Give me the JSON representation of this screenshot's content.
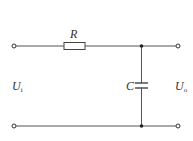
{
  "diagram": {
    "type": "RC low-pass filter circuit",
    "components": {
      "resistor": {
        "label": "R"
      },
      "capacitor": {
        "label": "C"
      }
    },
    "ports": {
      "input": {
        "label": "U",
        "subscript": "i"
      },
      "output": {
        "label": "U",
        "subscript": "o"
      }
    },
    "colors": {
      "wire": "#555555",
      "text": "#333333"
    }
  }
}
